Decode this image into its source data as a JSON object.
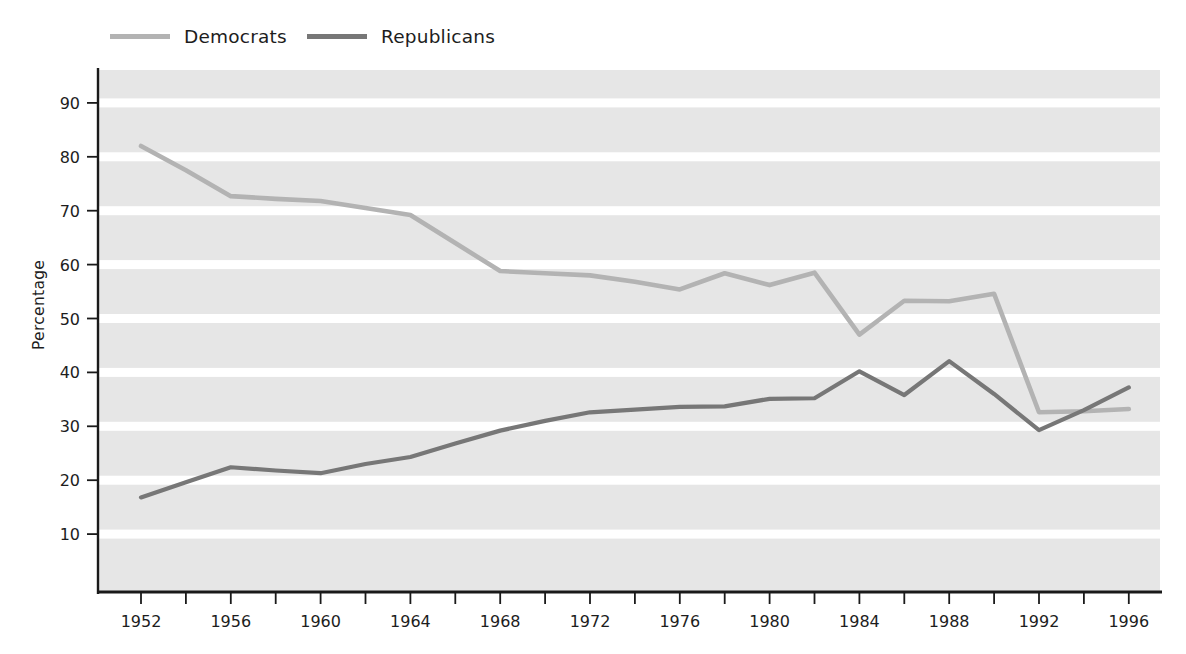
{
  "chart_data": {
    "type": "line",
    "title": "",
    "xlabel": "",
    "ylabel": "Percentage",
    "xlim": [
      1951,
      1997
    ],
    "ylim": [
      0,
      95
    ],
    "grid": true,
    "legend_position": "top-left",
    "x_tick_labels": [
      "1952",
      "1956",
      "1960",
      "1964",
      "1968",
      "1972",
      "1976",
      "1980",
      "1984",
      "1988",
      "1992",
      "1996"
    ],
    "x_tick_values": [
      1952,
      1956,
      1960,
      1964,
      1968,
      1972,
      1976,
      1980,
      1984,
      1988,
      1992,
      1996
    ],
    "x_minor_tick_values": [
      1954,
      1958,
      1962,
      1966,
      1970,
      1974,
      1978,
      1982,
      1986,
      1990,
      1994
    ],
    "y_tick_labels": [
      "10",
      "20",
      "30",
      "40",
      "50",
      "60",
      "70",
      "80",
      "90"
    ],
    "y_tick_values": [
      10,
      20,
      30,
      40,
      50,
      60,
      70,
      80,
      90
    ],
    "x": [
      1952,
      1954,
      1956,
      1958,
      1960,
      1962,
      1964,
      1966,
      1968,
      1970,
      1972,
      1974,
      1976,
      1978,
      1980,
      1982,
      1984,
      1986,
      1988,
      1990,
      1992,
      1994,
      1996
    ],
    "series": [
      {
        "name": "Democrats",
        "color": "#b3b3b3",
        "values": [
          82.0,
          77.5,
          72.7,
          72.2,
          71.8,
          70.5,
          69.2,
          64.0,
          58.8,
          58.4,
          58.0,
          56.8,
          55.4,
          58.4,
          56.2,
          58.5,
          47.0,
          53.3,
          53.2,
          54.6,
          32.6,
          32.8,
          33.2
        ]
      },
      {
        "name": "Republicans",
        "color": "#777777",
        "values": [
          16.8,
          19.6,
          22.4,
          21.8,
          21.3,
          23.0,
          24.3,
          26.8,
          29.2,
          31.0,
          32.6,
          33.1,
          33.6,
          33.7,
          35.1,
          35.2,
          40.2,
          35.8,
          42.1,
          36.0,
          29.3,
          33.0,
          37.2
        ]
      }
    ]
  },
  "legend": {
    "items": [
      {
        "label": "Democrats",
        "color": "#b3b3b3"
      },
      {
        "label": "Republicans",
        "color": "#777777"
      }
    ]
  },
  "axes": {
    "y_title": "Percentage"
  },
  "style": {
    "plot_background": "#e6e6e6",
    "gridline_color": "#ffffff",
    "axis_color": "#1a1a1a",
    "page_background": "#ffffff"
  }
}
